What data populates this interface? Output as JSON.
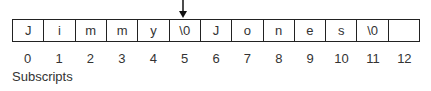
{
  "diagram": {
    "pointer_index": 5,
    "cells": [
      "J",
      "i",
      "m",
      "m",
      "y",
      "\\0",
      "J",
      "o",
      "n",
      "e",
      "s",
      "\\0",
      ""
    ],
    "indices": [
      "0",
      "1",
      "2",
      "3",
      "4",
      "5",
      "6",
      "7",
      "8",
      "9",
      "10",
      "11",
      "12"
    ],
    "caption": "Subscripts"
  }
}
